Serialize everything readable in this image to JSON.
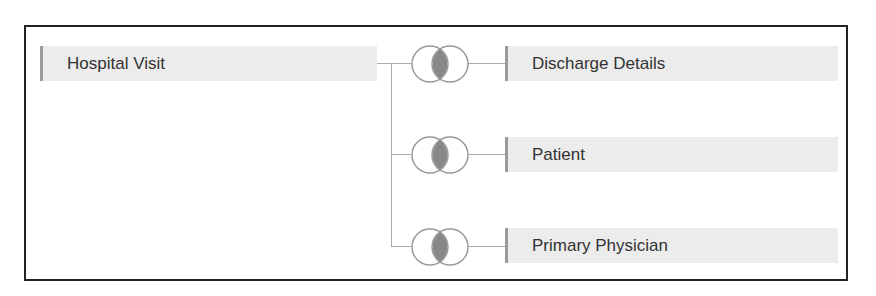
{
  "diagram": {
    "left_table": {
      "label": "Hospital Visit"
    },
    "joins": [
      {
        "type": "inner",
        "icon": "inner-join-icon",
        "right_table": {
          "label": "Discharge Details"
        }
      },
      {
        "type": "inner",
        "icon": "inner-join-icon",
        "right_table": {
          "label": "Patient"
        }
      },
      {
        "type": "inner",
        "icon": "inner-join-icon",
        "right_table": {
          "label": "Primary Physician"
        }
      }
    ],
    "colors": {
      "table_bg": "#ececec",
      "table_accent": "#9a9a9a",
      "join_fill": "#888888",
      "line": "#aaaaaa",
      "frame": "#222222"
    }
  }
}
